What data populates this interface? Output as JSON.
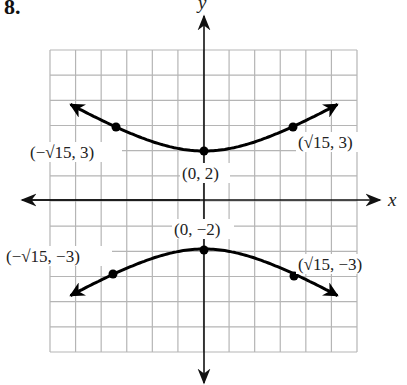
{
  "problem": {
    "number": "8."
  },
  "colors": {
    "grid": "#b5b5b5",
    "axis": "#111111",
    "curve": "#000000",
    "text": "#222222"
  },
  "axes": {
    "x_label": "x",
    "y_label": "y"
  },
  "labels": {
    "p1": "(−√15, 3)",
    "p2": "(√15, 3)",
    "p3": "(0, 2)",
    "p4": "(0, −2)",
    "p5": "(−√15, −3)",
    "p6": "(√15, −3)"
  },
  "chart_data": {
    "type": "line",
    "title": "",
    "xlabel": "x",
    "ylabel": "y",
    "xlim": [
      -6,
      6
    ],
    "ylim": [
      -6,
      6
    ],
    "grid": true,
    "grid_cells": {
      "x": 12,
      "y": 12
    },
    "series": [
      {
        "name": "upper branch",
        "points": [
          [
            -4.8,
            3.6
          ],
          [
            -3.873,
            3
          ],
          [
            0,
            2
          ],
          [
            3.873,
            3
          ],
          [
            4.8,
            3.6
          ]
        ]
      },
      {
        "name": "lower branch",
        "points": [
          [
            -4.8,
            -3.6
          ],
          [
            -3.873,
            -3
          ],
          [
            0,
            -2
          ],
          [
            3.873,
            -3
          ],
          [
            4.8,
            -3.6
          ]
        ]
      }
    ],
    "annotations": [
      {
        "text": "(−√15, 3)",
        "x": -3.873,
        "y": 3
      },
      {
        "text": "(√15, 3)",
        "x": 3.873,
        "y": 3
      },
      {
        "text": "(0, 2)",
        "x": 0,
        "y": 2
      },
      {
        "text": "(0, −2)",
        "x": 0,
        "y": -2
      },
      {
        "text": "(−√15, −3)",
        "x": -3.873,
        "y": -3
      },
      {
        "text": "(√15, −3)",
        "x": 3.873,
        "y": -3
      }
    ]
  }
}
